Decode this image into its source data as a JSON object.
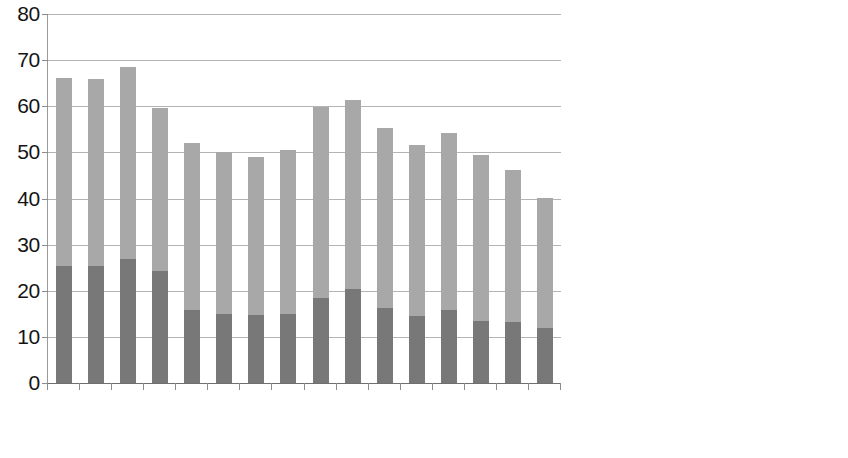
{
  "chart_data": {
    "type": "bar",
    "subtype": "stacked-vertical-bar",
    "title": "",
    "subtitle": "",
    "xlabel": "",
    "ylabel": "",
    "ylim": [
      0,
      80
    ],
    "y_ticks": [
      0,
      10,
      20,
      30,
      40,
      50,
      60,
      70,
      80
    ],
    "y_tick_labels": [
      "80",
      "70",
      "60",
      "50",
      "40",
      "30",
      "20",
      "10",
      "0"
    ],
    "grid": true,
    "grid_axis": "y",
    "legend_position": "right",
    "categories": [
      "TM01",
      "TM02",
      "TM03",
      "TM04",
      "TM05",
      "TM06",
      "TM07",
      "TM08",
      "TM09",
      "TM10",
      "TM11",
      "TM12",
      "TM13",
      "TM14",
      "TM15",
      "TM16"
    ],
    "series": [
      {
        "name": "Compressive Strength after 7 Days",
        "color": "#787878",
        "stack_order": 0,
        "values": [
          25.4,
          25.4,
          26.9,
          24.3,
          15.8,
          15.0,
          14.8,
          15.0,
          18.4,
          20.4,
          16.3,
          14.5,
          15.8,
          13.5,
          13.2,
          11.9
        ]
      },
      {
        "name": "Compressive Strength after 28 Days",
        "color": "#a8a8a8",
        "stack_order": 1,
        "values": [
          40.8,
          40.6,
          41.7,
          35.4,
          36.3,
          35.1,
          34.2,
          35.5,
          41.5,
          41.0,
          39.0,
          37.1,
          38.4,
          36.0,
          33.0,
          28.2
        ]
      }
    ],
    "totals": [
      66.2,
      66.0,
      68.6,
      59.7,
      52.1,
      50.1,
      49.0,
      50.5,
      59.9,
      61.4,
      55.3,
      51.6,
      54.2,
      49.5,
      46.2,
      40.1
    ]
  },
  "legend": {
    "entries": [
      {
        "label_line1": "Compressive Strength",
        "label_line2": "after 28 Days",
        "color": "#a8a8a8"
      },
      {
        "label_line1": "Compressive Strength",
        "label_line2": "after 7 Days",
        "color": "#787878"
      }
    ]
  },
  "axes": {
    "y_tick_labels": [
      "80",
      "70",
      "60",
      "50",
      "40",
      "30",
      "20",
      "10",
      "0"
    ],
    "x_tick_labels": [
      "TM01",
      "TM02",
      "TM03",
      "TM04",
      "TM05",
      "TM06",
      "TM07",
      "TM08",
      "TM09",
      "TM10",
      "TM11",
      "TM12",
      "TM13",
      "TM14",
      "TM15",
      "TM16"
    ]
  }
}
